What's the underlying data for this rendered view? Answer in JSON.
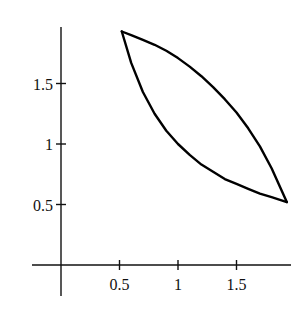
{
  "chart_data": {
    "type": "line",
    "title": "",
    "xlabel": "",
    "ylabel": "",
    "xlim": [
      -0.25,
      1.97
    ],
    "ylim": [
      -0.25,
      1.97
    ],
    "grid": false,
    "legend": null,
    "x_ticks": [
      0.5,
      1,
      1.5
    ],
    "x_tick_labels": [
      "0.5",
      "1",
      "1.5"
    ],
    "y_ticks": [
      0.5,
      1,
      1.5
    ],
    "y_tick_labels": [
      "0.5",
      "1",
      "1.5"
    ],
    "series": [
      {
        "name": "lower boundary (y = 1/x)",
        "x": [
          0.52,
          0.6,
          0.7,
          0.8,
          0.9,
          1.0,
          1.1,
          1.2,
          1.3,
          1.4,
          1.5,
          1.6,
          1.7,
          1.8,
          1.93
        ],
        "y": [
          1.93,
          1.67,
          1.43,
          1.25,
          1.11,
          1.0,
          0.91,
          0.83,
          0.77,
          0.71,
          0.67,
          0.63,
          0.59,
          0.56,
          0.52
        ]
      },
      {
        "name": "upper boundary",
        "x": [
          0.52,
          0.6,
          0.7,
          0.8,
          0.9,
          1.0,
          1.1,
          1.2,
          1.3,
          1.4,
          1.5,
          1.6,
          1.7,
          1.8,
          1.93
        ],
        "y": [
          1.93,
          1.9,
          1.86,
          1.82,
          1.77,
          1.71,
          1.64,
          1.56,
          1.47,
          1.37,
          1.26,
          1.13,
          0.98,
          0.8,
          0.52
        ]
      }
    ],
    "colors": {
      "curve": "#000000",
      "axes": "#111111",
      "background": "#ffffff"
    }
  }
}
